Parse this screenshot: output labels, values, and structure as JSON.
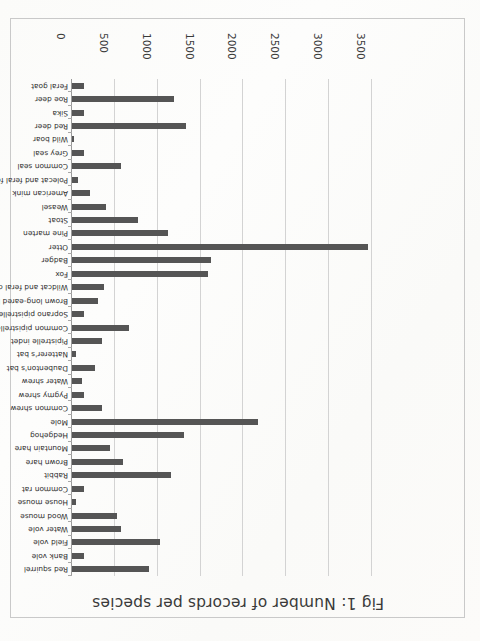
{
  "page": {
    "orientation": "rotated-180",
    "background": "#fdfdfb",
    "frame_color": "#c9c9c9"
  },
  "chart_data": {
    "type": "bar",
    "orientation": "horizontal",
    "title": "Fig 1: Number of records per species",
    "xlabel": "",
    "ylabel": "",
    "xlim": [
      0,
      3500
    ],
    "grid": true,
    "legend": "none",
    "bar_color": "#555555",
    "gridline_color": "#d3d3d3",
    "tick_labels": [
      "0",
      "500",
      "1000",
      "1500",
      "2000",
      "2500",
      "3000",
      "3500"
    ],
    "tick_values": [
      0,
      500,
      1000,
      1500,
      2000,
      2500,
      3000,
      3500
    ],
    "categories": [
      "Red squirrel",
      "Bank vole",
      "Field vole",
      "Water vole",
      "Wood mouse",
      "House mouse",
      "Common rat",
      "Rabbit",
      "Brown hare",
      "Mountain hare",
      "Hedgehog",
      "Mole",
      "Common shrew",
      "Pygmy shrew",
      "Water shrew",
      "Daubenton's bat",
      "Natterer's bat",
      "Pipistrelle indet",
      "Common pipistrelle",
      "Soprano pipistrelle",
      "Brown long-eared bat",
      "Wildcat and feral cat",
      "Fox",
      "Badger",
      "Otter",
      "Pine marten",
      "Stoat",
      "Weasel",
      "American mink",
      "Polecat and feral ferret",
      "Common seal",
      "Grey seal",
      "Wild boar",
      "Red deer",
      "Sika",
      "Roe deer",
      "Feral goat"
    ],
    "values": [
      900,
      135,
      1025,
      575,
      525,
      50,
      145,
      1160,
      600,
      440,
      1305,
      2170,
      355,
      145,
      120,
      270,
      50,
      355,
      670,
      145,
      305,
      370,
      1585,
      1620,
      3450,
      1120,
      770,
      400,
      205,
      75,
      575,
      145,
      20,
      1330,
      145,
      1195,
      135
    ]
  }
}
